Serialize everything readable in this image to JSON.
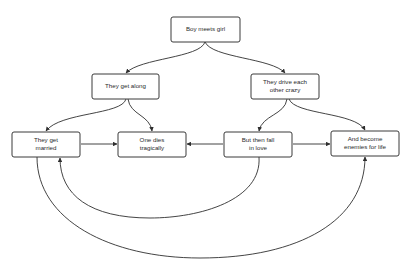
{
  "diagram": {
    "type": "flowchart",
    "background": "#ffffff",
    "node_stroke": "#3a3a3a",
    "edge_stroke": "#2f2f2f",
    "nodes": [
      {
        "id": "boy-meets-girl",
        "lines": [
          "Boy meets girl"
        ],
        "x": 171,
        "y": 17,
        "w": 69,
        "h": 25
      },
      {
        "id": "they-get-along",
        "lines": [
          "They get along"
        ],
        "x": 92,
        "y": 74,
        "w": 67,
        "h": 25
      },
      {
        "id": "they-drive-each-other-crazy",
        "lines": [
          "They drive each",
          "other crazy"
        ],
        "x": 251,
        "y": 74,
        "w": 68,
        "h": 25
      },
      {
        "id": "they-get-married",
        "lines": [
          "They get",
          "married"
        ],
        "x": 12,
        "y": 132,
        "w": 68,
        "h": 25
      },
      {
        "id": "one-dies-tragically",
        "lines": [
          "One dies",
          "tragically"
        ],
        "x": 118,
        "y": 132,
        "w": 68,
        "h": 25
      },
      {
        "id": "but-then-fall-in-love",
        "lines": [
          "But then fall",
          "in love"
        ],
        "x": 224,
        "y": 132,
        "w": 68,
        "h": 25
      },
      {
        "id": "and-become-enemies-for-life",
        "lines": [
          "And become",
          "enemies for life"
        ],
        "x": 331,
        "y": 131,
        "w": 68,
        "h": 25
      }
    ],
    "edges": [
      {
        "from": "boy-meets-girl",
        "to": "they-get-along",
        "d": "M205,42 C200,58 140,58 126,73"
      },
      {
        "from": "boy-meets-girl",
        "to": "they-drive-each-other-crazy",
        "d": "M205,42 C212,58 272,58 285,73"
      },
      {
        "from": "they-get-along",
        "to": "they-get-married",
        "d": "M126,99 C122,115 60,112 46,131"
      },
      {
        "from": "they-get-along",
        "to": "one-dies-tragically",
        "d": "M128,99 C130,115 150,115 152,131"
      },
      {
        "from": "they-drive-each-other-crazy",
        "to": "but-then-fall-in-love",
        "d": "M287,99 C285,115 262,115 259,131"
      },
      {
        "from": "they-drive-each-other-crazy",
        "to": "and-become-enemies-for-life",
        "d": "M289,99 C295,115 355,112 365,130"
      },
      {
        "from": "they-get-married",
        "to": "one-dies-tragically",
        "d": "M81,144 L117,144"
      },
      {
        "from": "but-then-fall-in-love",
        "to": "one-dies-tragically",
        "d": "M223,144 L187,144"
      },
      {
        "from": "but-then-fall-in-love",
        "to": "and-become-enemies-for-life",
        "d": "M293,144 L330,144"
      },
      {
        "from": "but-then-fall-in-love",
        "to": "they-get-married",
        "d": "M259,157 C262,200 200,218 150,218 C90,218 60,195 60,158"
      },
      {
        "from": "they-get-married",
        "to": "and-become-enemies-for-life",
        "d": "M37,157 C37,220 110,258 200,258 C300,258 365,220 365,157"
      }
    ]
  }
}
